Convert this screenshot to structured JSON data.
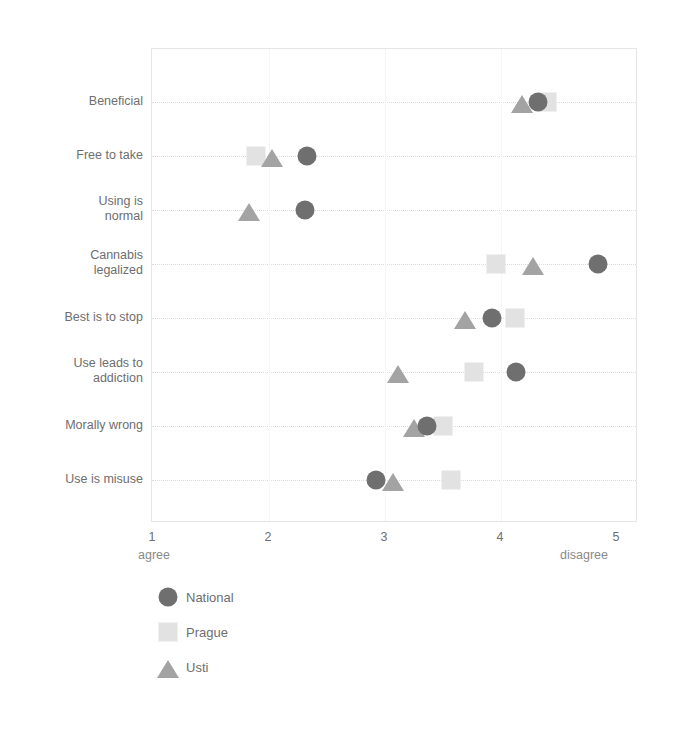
{
  "chart_data": {
    "type": "scatter",
    "title": "",
    "subtitle": "",
    "xlabel": "",
    "ylabel": "",
    "xlim": [
      1,
      5
    ],
    "xticks": [
      1,
      2,
      3,
      4,
      5
    ],
    "xtick_labels": [
      "1",
      "2",
      "3",
      "4",
      "5"
    ],
    "x_axis_low_label": "agree",
    "x_axis_high_label": "disagree",
    "grid": true,
    "legend_position": "bottom-left",
    "categories": [
      "Beneficial",
      "Free to take",
      "Using is\nnormal",
      "Cannabis\nlegalized",
      "Best is to stop",
      "Use leads to\naddiction",
      "Morally wrong",
      "Use is misuse"
    ],
    "series": [
      {
        "name": "National",
        "marker": "circle",
        "color": "#706f6f",
        "values": [
          4.32,
          2.33,
          2.31,
          4.84,
          3.92,
          4.13,
          3.36,
          2.92
        ]
      },
      {
        "name": "Prague",
        "marker": "square",
        "color": "#e2e2e2",
        "values": [
          4.4,
          1.89,
          null,
          3.96,
          4.12,
          3.77,
          3.5,
          3.57
        ]
      },
      {
        "name": "Usti",
        "marker": "triangle",
        "color": "#a3a3a3",
        "values": [
          4.18,
          2.03,
          1.83,
          4.28,
          3.69,
          3.11,
          3.25,
          3.07
        ]
      }
    ]
  },
  "legend": {
    "items": [
      {
        "label": "National",
        "marker": "circle",
        "color": "#706f6f"
      },
      {
        "label": "Prague",
        "marker": "square",
        "color": "#e2e2e2"
      },
      {
        "label": "Usti",
        "marker": "triangle",
        "color": "#a3a3a3"
      }
    ]
  },
  "axis": {
    "tick_labels": [
      "1",
      "2",
      "3",
      "4",
      "5"
    ],
    "low_label": "agree",
    "high_label": "disagree"
  }
}
